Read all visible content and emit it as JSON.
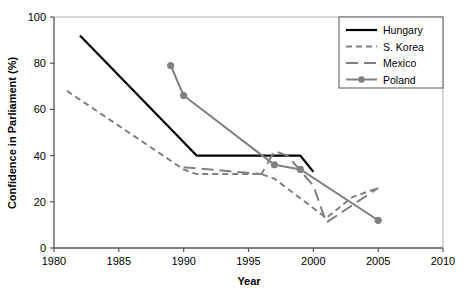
{
  "chart_data": {
    "type": "line",
    "title": "",
    "xlabel": "Year",
    "ylabel": "Confidence in Parliament (%)",
    "xlim": [
      1980,
      2010
    ],
    "ylim": [
      0,
      100
    ],
    "xticks": [
      1980,
      1985,
      1990,
      1995,
      2000,
      2005,
      2010
    ],
    "yticks": [
      0,
      20,
      40,
      60,
      80,
      100
    ],
    "grid": false,
    "legend_position": "top-right",
    "series": [
      {
        "name": "Hungary",
        "color": "#000000",
        "style": "solid",
        "marker": "none",
        "x": [
          1982,
          1991,
          1999,
          2000
        ],
        "y": [
          92,
          40,
          40,
          33
        ]
      },
      {
        "name": "S. Korea",
        "color": "#808080",
        "style": "dashed",
        "marker": "none",
        "x": [
          1981,
          1990,
          1991,
          1996,
          1997,
          2001,
          2003,
          2005
        ],
        "y": [
          68,
          34,
          32,
          32,
          30,
          13,
          22,
          26
        ]
      },
      {
        "name": "Mexico",
        "color": "#808080",
        "style": "longdash",
        "marker": "none",
        "x": [
          1990,
          1996,
          1997,
          1998,
          2000,
          2001,
          2005
        ],
        "y": [
          35,
          32,
          42,
          40,
          27,
          11,
          26
        ]
      },
      {
        "name": "Poland",
        "color": "#808080",
        "style": "solid",
        "marker": "circle",
        "x": [
          1989,
          1990,
          1997,
          1999,
          2005
        ],
        "y": [
          79,
          66,
          36,
          34,
          12
        ]
      }
    ]
  },
  "legend": {
    "entries": [
      {
        "label": "Hungary"
      },
      {
        "label": "S. Korea"
      },
      {
        "label": "Mexico"
      },
      {
        "label": "Poland"
      }
    ]
  },
  "axes": {
    "x_tick_labels": [
      "1980",
      "1985",
      "1990",
      "1995",
      "2000",
      "2005",
      "2010"
    ],
    "y_tick_labels": [
      "0",
      "20",
      "40",
      "60",
      "80",
      "100"
    ],
    "x_title": "Year",
    "y_title": "Confidence in Parliament (%)"
  }
}
